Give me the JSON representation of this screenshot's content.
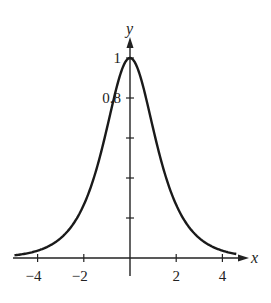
{
  "chart_data": {
    "type": "line",
    "title": "",
    "xlabel": "x",
    "ylabel": "y",
    "xlim": [
      -5,
      5
    ],
    "ylim": [
      0,
      1.1
    ],
    "grid": false,
    "legend": null,
    "x_ticks": [
      -4,
      -2,
      0,
      2,
      4
    ],
    "x_tick_labels": [
      "−4",
      "−2",
      "",
      "2",
      "4"
    ],
    "y_ticks": [
      0.2,
      0.4,
      0.6,
      0.8,
      1.0
    ],
    "y_tick_labels": [
      "",
      "",
      "",
      "0.8",
      "1"
    ],
    "series": [
      {
        "name": "sech(x)",
        "x": [
          -5,
          -4,
          -3,
          -2.5,
          -2,
          -1.5,
          -1,
          -0.5,
          0,
          0.5,
          1,
          1.5,
          2,
          2.5,
          3,
          4,
          5
        ],
        "values": [
          0.013,
          0.037,
          0.099,
          0.163,
          0.266,
          0.425,
          0.648,
          0.887,
          1.0,
          0.887,
          0.648,
          0.425,
          0.266,
          0.163,
          0.099,
          0.037,
          0.013
        ]
      }
    ]
  }
}
